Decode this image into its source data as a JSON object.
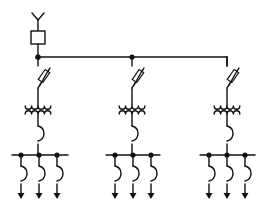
{
  "diagram": {
    "width": 266,
    "height": 210,
    "colors": {
      "stroke": "#111111",
      "background": "#ffffff"
    },
    "source": {
      "antenna_icon": "antenna-icon",
      "box_icon": "source-box-icon",
      "x": 38,
      "antenna_top_y": 13,
      "antenna_join_y": 20,
      "box": {
        "x": 31,
        "y": 31,
        "w": 14,
        "h": 13
      },
      "junction_y": 57
    },
    "main_bus": {
      "x1": 38,
      "x2": 227,
      "y": 57
    },
    "branches": [
      {
        "id": "left",
        "x": 38,
        "bus_x1": 12,
        "bus_x2": 68,
        "feeders": [
          21,
          39,
          57
        ]
      },
      {
        "id": "middle",
        "x": 132,
        "bus_x1": 106,
        "bus_x2": 160,
        "feeders": [
          115,
          133,
          151
        ]
      },
      {
        "id": "right",
        "x": 227,
        "bus_x1": 200,
        "bus_x2": 255,
        "feeders": [
          209,
          227,
          245
        ]
      }
    ],
    "branch_geometry": {
      "fuse_top_y": 70,
      "fuse_bottom_y": 86,
      "transformer_primary_y": 106,
      "transformer_secondary_y": 114,
      "coil_count": 4,
      "coil_radius": 3.2,
      "switch_top_y": 126,
      "switch_bottom_y": 142,
      "sub_bus_y": 155,
      "feeder_switch_top_y": 166,
      "feeder_switch_bottom_y": 182,
      "arrow_tip_y": 199
    },
    "symbols": {
      "antenna": "antenna-icon",
      "fuse": "fuse-icon",
      "transformer": "transformer-icon",
      "switch": "switch-icon",
      "load_arrow": "load-arrow-icon",
      "junction": "junction-dot-icon"
    }
  }
}
